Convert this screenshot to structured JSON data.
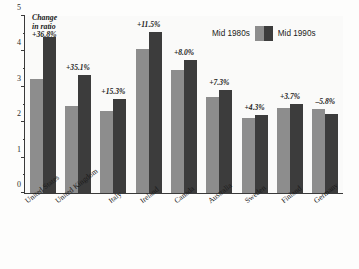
{
  "chart_data": {
    "type": "bar",
    "title": "",
    "xlabel": "",
    "ylabel": "",
    "ylim": [
      0,
      5
    ],
    "yticks": [
      0,
      1,
      2,
      3,
      4,
      5
    ],
    "grid": false,
    "legend_position": "top-right",
    "categories": [
      "United States",
      "United Kingdom",
      "Italy",
      "Ireland",
      "Canada",
      "Australia",
      "Sweden",
      "Finland",
      "Germany"
    ],
    "series": [
      {
        "name": "Mid 1980s",
        "color": "#8d8d8d",
        "values": [
          3.2,
          2.45,
          2.3,
          4.05,
          3.45,
          2.7,
          2.1,
          2.4,
          2.35
        ]
      },
      {
        "name": "Mid 1990s",
        "color": "#3c3c3c",
        "values": [
          4.38,
          3.31,
          2.65,
          4.52,
          3.73,
          2.9,
          2.19,
          2.49,
          2.21
        ]
      }
    ],
    "annotations": [
      "+36.8%",
      "+35.1%",
      "+15.3%",
      "+11.5%",
      "+8.0%",
      "+7.3%",
      "+4.3%",
      "+3.7%",
      "–5.8%"
    ],
    "callout": {
      "line1": "Change",
      "line2": "in ratio",
      "line3": "+36.8%"
    }
  },
  "legend": {
    "left_label": "Mid 1980s",
    "right_label": "Mid 1990s"
  }
}
